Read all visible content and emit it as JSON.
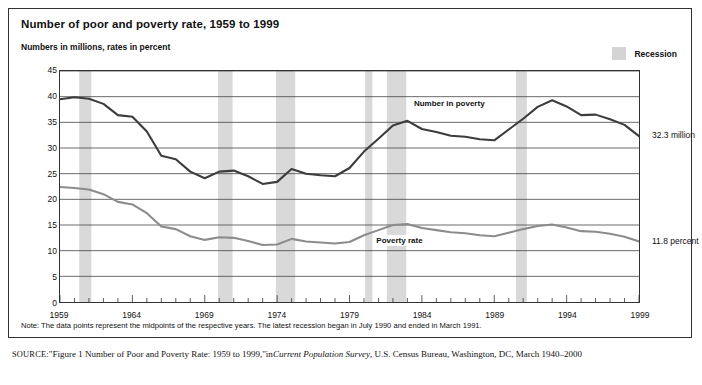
{
  "figure": {
    "title": "Number of poor and poverty rate, 1959 to 1999",
    "subtitle": "Numbers in millions, rates in percent",
    "legend_label": "Recession",
    "note": "Note: The data points represent the midpoints of the respective years. The latest recession began in July 1990 and ended in March 1991.",
    "source_prefix": "SOURCE:",
    "source_quoted": "\"Figure 1 Number of Poor and Poverty Rate: 1959 to 1999,\"",
    "source_in": "in",
    "source_italic": "Current Population Survey",
    "source_tail": ", U.S. Census Bureau, Washington, DC, March 1940–2000",
    "end_label_number": "32.3 million",
    "end_label_rate": "11.8 percent"
  },
  "chart_data": {
    "type": "line",
    "title": "Number of poor and poverty rate, 1959 to 1999",
    "subtitle": "Numbers in millions, rates in percent",
    "xlabel": "",
    "ylabel": "Numbers in millions, rates in percent",
    "xlim": [
      1959,
      1999
    ],
    "ylim": [
      0,
      45
    ],
    "ytick_values": [
      0,
      5,
      10,
      15,
      20,
      25,
      30,
      35,
      40,
      45
    ],
    "ytick_labels": [
      "0",
      "5",
      "10",
      "15",
      "20",
      "25",
      "30",
      "35",
      "40",
      "45"
    ],
    "xtick_values": [
      1959,
      1964,
      1969,
      1974,
      1979,
      1984,
      1989,
      1994,
      1999
    ],
    "xtick_labels": [
      "1959",
      "1964",
      "1969",
      "1974",
      "1979",
      "1984",
      "1989",
      "1994",
      "1999"
    ],
    "minor_xticks_every": 1,
    "grid": "horizontal",
    "legend_position": "top-right",
    "x": [
      1959,
      1960,
      1961,
      1962,
      1963,
      1964,
      1965,
      1966,
      1967,
      1968,
      1969,
      1970,
      1971,
      1972,
      1973,
      1974,
      1975,
      1976,
      1977,
      1978,
      1979,
      1980,
      1981,
      1982,
      1983,
      1984,
      1985,
      1986,
      1987,
      1988,
      1989,
      1990,
      1991,
      1992,
      1993,
      1994,
      1995,
      1996,
      1997,
      1998,
      1999
    ],
    "series": [
      {
        "name": "Number in poverty",
        "units": "millions",
        "color": "#3c3c3c",
        "label_text": "Number in poverty",
        "values": [
          39.5,
          39.9,
          39.6,
          38.6,
          36.4,
          36.1,
          33.2,
          28.5,
          27.8,
          25.4,
          24.1,
          25.4,
          25.6,
          24.5,
          23.0,
          23.4,
          25.9,
          25.0,
          24.7,
          24.5,
          26.1,
          29.3,
          31.8,
          34.4,
          35.3,
          33.7,
          33.1,
          32.4,
          32.2,
          31.7,
          31.5,
          33.6,
          35.7,
          38.0,
          39.3,
          38.1,
          36.4,
          36.5,
          35.6,
          34.5,
          32.3
        ]
      },
      {
        "name": "Poverty rate",
        "units": "percent",
        "color": "#8c8c8c",
        "label_text": "Poverty rate",
        "values": [
          22.4,
          22.2,
          21.9,
          21.0,
          19.5,
          19.0,
          17.3,
          14.7,
          14.2,
          12.8,
          12.1,
          12.6,
          12.5,
          11.9,
          11.1,
          11.2,
          12.3,
          11.8,
          11.6,
          11.4,
          11.7,
          13.0,
          14.0,
          15.0,
          15.2,
          14.4,
          14.0,
          13.6,
          13.4,
          13.0,
          12.8,
          13.5,
          14.2,
          14.8,
          15.1,
          14.5,
          13.8,
          13.7,
          13.3,
          12.7,
          11.8
        ]
      }
    ],
    "recessions": [
      {
        "start": 1960.33,
        "end": 1961.17
      },
      {
        "start": 1969.92,
        "end": 1970.92
      },
      {
        "start": 1973.92,
        "end": 1975.25
      },
      {
        "start": 1980.08,
        "end": 1980.58
      },
      {
        "start": 1981.58,
        "end": 1982.92
      },
      {
        "start": 1990.5,
        "end": 1991.25
      }
    ],
    "recession_color": "#d9d9d9",
    "annotations": [
      {
        "text": "32.3 million",
        "x": 1999,
        "y": 32.3,
        "position": "right-of-axis"
      },
      {
        "text": "11.8 percent",
        "x": 1999,
        "y": 11.8,
        "position": "right-of-axis"
      }
    ]
  }
}
